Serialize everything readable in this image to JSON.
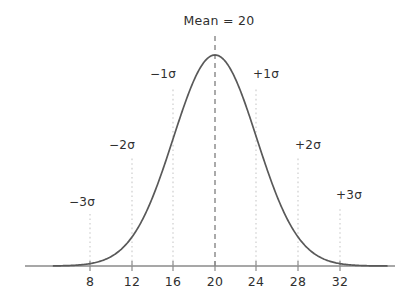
{
  "chart_data": {
    "type": "line",
    "title": "Mean = 20",
    "xlabel": "",
    "ylabel": "",
    "grid": false,
    "legend": null,
    "distribution": "normal",
    "mean": 20,
    "sigma": 4,
    "xlim": [
      4.5,
      36.5
    ],
    "ylim": [
      0,
      1.06
    ],
    "x_ticks": [
      8,
      12,
      16,
      20,
      24,
      28,
      32
    ],
    "x_tick_labels": [
      "8",
      "12",
      "16",
      "20",
      "24",
      "28",
      "32"
    ],
    "annotations": [
      {
        "id": "mean-line",
        "label": "Mean = 20",
        "x": 20,
        "style": "dashed"
      },
      {
        "id": "minus-3-sigma",
        "label": "−3σ",
        "x": 8,
        "style": "dotted"
      },
      {
        "id": "minus-2-sigma",
        "label": "−2σ",
        "x": 12,
        "style": "dotted"
      },
      {
        "id": "minus-1-sigma",
        "label": "−1σ",
        "x": 16,
        "style": "dotted"
      },
      {
        "id": "plus-1-sigma",
        "label": "+1σ",
        "x": 24,
        "style": "dotted"
      },
      {
        "id": "plus-2-sigma",
        "label": "+2σ",
        "x": 28,
        "style": "dotted"
      },
      {
        "id": "plus-3-sigma",
        "label": "+3σ",
        "x": 32,
        "style": "dotted"
      }
    ],
    "curve_points": [
      {
        "x": 4.5,
        "y": 0.0
      },
      {
        "x": 6.0,
        "y": 0.0003
      },
      {
        "x": 8.0,
        "y": 0.0111
      },
      {
        "x": 10.0,
        "y": 0.0439
      },
      {
        "x": 12.0,
        "y": 0.1353
      },
      {
        "x": 14.0,
        "y": 0.3247
      },
      {
        "x": 16.0,
        "y": 0.6065
      },
      {
        "x": 18.0,
        "y": 0.8825
      },
      {
        "x": 20.0,
        "y": 1.0
      },
      {
        "x": 22.0,
        "y": 0.8825
      },
      {
        "x": 24.0,
        "y": 0.6065
      },
      {
        "x": 26.0,
        "y": 0.3247
      },
      {
        "x": 28.0,
        "y": 0.1353
      },
      {
        "x": 30.0,
        "y": 0.0439
      },
      {
        "x": 32.0,
        "y": 0.0111
      },
      {
        "x": 34.0,
        "y": 0.0003
      },
      {
        "x": 36.5,
        "y": 0.0
      }
    ]
  },
  "colors": {
    "curve": "#595959",
    "axis": "#8a8a8a",
    "mean_line": "#7d7d7d",
    "sigma_line": "#c9c9c9",
    "tick": "#8a8a8a",
    "text": "#2f2f2f",
    "background": "#ffffff"
  },
  "labels": {
    "title": "Mean = 20",
    "sigma_neg3": "−3σ",
    "sigma_neg2": "−2σ",
    "sigma_neg1": "−1σ",
    "sigma_pos1": "+1σ",
    "sigma_pos2": "+2σ",
    "sigma_pos3": "+3σ",
    "tick_8": "8",
    "tick_12": "12",
    "tick_16": "16",
    "tick_20": "20",
    "tick_24": "24",
    "tick_28": "28",
    "tick_32": "32"
  }
}
